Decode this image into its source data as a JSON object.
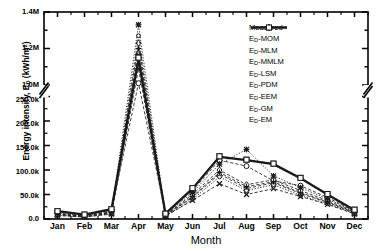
{
  "chart_data": {
    "type": "line",
    "title": "",
    "xlabel": "Month",
    "ylabel_prefix": "Energy intensity, E",
    "ylabel_sub": "D",
    "ylabel_suffix": " (kWh/m",
    "ylabel_sup": "2",
    "ylabel_end": ")",
    "ylabel_full": "Energy intensity, E_D (kWh/m2)",
    "categories": [
      "Jan",
      "Feb",
      "Mar",
      "Apr",
      "May",
      "Jun",
      "Jul",
      "Aug",
      "Sep",
      "Oct",
      "Nov",
      "Dec"
    ],
    "broken_axis": true,
    "y_lower_range": [
      0,
      250000
    ],
    "y_upper_range": [
      1000000,
      1400000
    ],
    "y_lower_ticks": [
      0,
      50000,
      100000,
      150000,
      200000,
      250000
    ],
    "y_upper_ticks": [
      1000000,
      1200000,
      1400000
    ],
    "y_tick_labels": [
      "0.0",
      "50.0k",
      "100.0k",
      "150.0k",
      "200.0k",
      "250.0k",
      "1.0M",
      "1.2M",
      "1.4M"
    ],
    "grid": false,
    "legend_position": "upper-right",
    "series": [
      {
        "name": "Measured",
        "marker": "none",
        "style": "solid-thick",
        "values": [
          16000,
          9000,
          20000,
          1140000,
          11000,
          62000,
          127000,
          120000,
          112000,
          83000,
          50000,
          18000
        ]
      },
      {
        "name": "E_D-MOM",
        "marker": "circle",
        "style": "dashed",
        "values": [
          14000,
          8000,
          18000,
          1010000,
          10000,
          58000,
          120000,
          108000,
          78000,
          68000,
          44000,
          16000
        ]
      },
      {
        "name": "E_D-MLM",
        "marker": "triangle",
        "style": "dashed",
        "values": [
          9000,
          5000,
          12000,
          1180000,
          7000,
          44000,
          92000,
          62000,
          74000,
          52000,
          34000,
          12000
        ]
      },
      {
        "name": "E_D-MMLM",
        "marker": "diamond",
        "style": "dashed",
        "values": [
          11000,
          6000,
          15000,
          1230000,
          8000,
          50000,
          100000,
          70000,
          80000,
          58000,
          38000,
          14000
        ]
      },
      {
        "name": "E_D-LSM",
        "marker": "small-circle",
        "style": "dotted",
        "values": [
          8000,
          4000,
          11000,
          1270000,
          6000,
          40000,
          86000,
          58000,
          70000,
          48000,
          31000,
          11000
        ]
      },
      {
        "name": "E_D-PDM",
        "marker": "plus",
        "style": "dashed",
        "values": [
          10000,
          5500,
          13000,
          1200000,
          7500,
          46000,
          95000,
          66000,
          76000,
          54000,
          35000,
          13000
        ]
      },
      {
        "name": "E_D-EEM",
        "marker": "x",
        "style": "dashed",
        "values": [
          7000,
          4000,
          10000,
          1090000,
          6000,
          38000,
          72000,
          50000,
          62000,
          46000,
          30000,
          10000
        ]
      },
      {
        "name": "E_D-GM",
        "marker": "asterisk",
        "style": "dotted",
        "values": [
          12000,
          7000,
          16000,
          1330000,
          9000,
          54000,
          112000,
          142000,
          88000,
          64000,
          41000,
          15000
        ]
      },
      {
        "name": "E_D-EM",
        "marker": "square",
        "style": "dashed",
        "values": [
          16000,
          9000,
          20000,
          1150000,
          11000,
          63000,
          128000,
          121000,
          113000,
          84000,
          51000,
          19000
        ]
      }
    ]
  },
  "legend": {
    "items": [
      {
        "label_prefix": "Measured",
        "sub": "",
        "suffix": "",
        "marker": "none",
        "style": "solid-thick"
      },
      {
        "label_prefix": "E",
        "sub": "D",
        "suffix": "-MOM",
        "marker": "circle",
        "style": "dashed"
      },
      {
        "label_prefix": "E",
        "sub": "D",
        "suffix": "-MLM",
        "marker": "triangle",
        "style": "dashed"
      },
      {
        "label_prefix": "E",
        "sub": "D",
        "suffix": "-MMLM",
        "marker": "diamond",
        "style": "dashed"
      },
      {
        "label_prefix": "E",
        "sub": "D",
        "suffix": "-LSM",
        "marker": "small-circle",
        "style": "dotted"
      },
      {
        "label_prefix": "E",
        "sub": "D",
        "suffix": "-PDM",
        "marker": "plus",
        "style": "dashed"
      },
      {
        "label_prefix": "E",
        "sub": "D",
        "suffix": "-EEM",
        "marker": "x",
        "style": "dashed"
      },
      {
        "label_prefix": "E",
        "sub": "D",
        "suffix": "-GM",
        "marker": "asterisk",
        "style": "dotted"
      },
      {
        "label_prefix": "E",
        "sub": "D",
        "suffix": "-EM",
        "marker": "square",
        "style": "dashed"
      }
    ]
  },
  "colors": {
    "line": "#1a1a1a",
    "axis": "#000000",
    "background": "#ffffff"
  }
}
